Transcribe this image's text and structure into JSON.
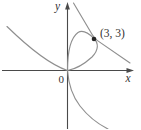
{
  "figure": {
    "background": "#ffffff",
    "colors": {
      "axes": "#4a4a4a",
      "curve": "#8f8f8f",
      "tangent_line": "#8f8f8f",
      "point_dot": "#262626",
      "text": "#333333"
    },
    "labels": {
      "y_axis": "y",
      "x_axis": "x",
      "origin": "0",
      "point": "(3, 3)"
    },
    "point": {
      "x": 3,
      "y": 3
    }
  }
}
